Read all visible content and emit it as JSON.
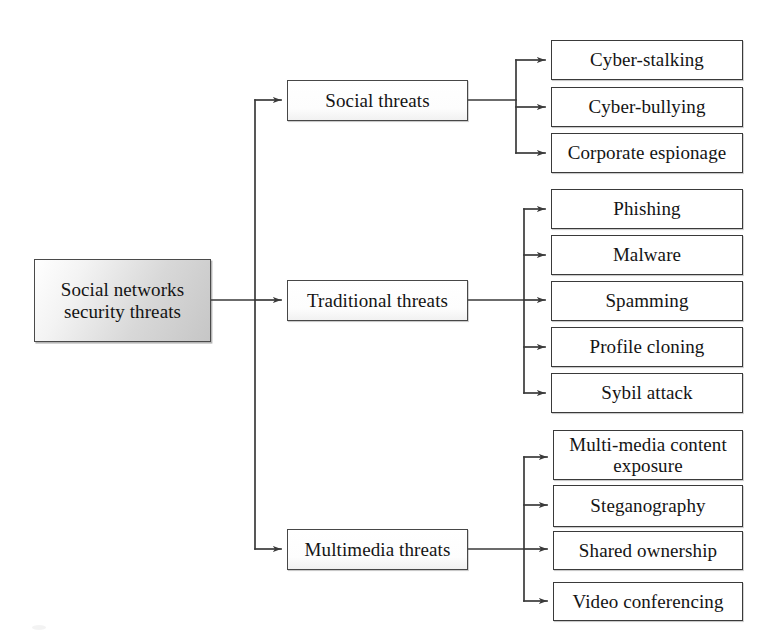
{
  "diagram": {
    "title": "Social networks security threats",
    "type": "tree-hierarchy",
    "orientation": "left-to-right",
    "background_color": "#ffffff",
    "line_color": "#3a3a3a",
    "root_fill_color": "#d8d8d8",
    "box_fill_color": "#ffffff"
  },
  "root": {
    "label": "Social networks\nsecurity threats"
  },
  "branches": [
    {
      "id": "social",
      "label": "Social threats",
      "children": [
        {
          "label": "Cyber-stalking"
        },
        {
          "label": "Cyber-bullying"
        },
        {
          "label": "Corporate espionage"
        }
      ]
    },
    {
      "id": "traditional",
      "label": "Traditional threats",
      "children": [
        {
          "label": "Phishing"
        },
        {
          "label": "Malware"
        },
        {
          "label": "Spamming"
        },
        {
          "label": "Profile cloning"
        },
        {
          "label": "Sybil attack"
        }
      ]
    },
    {
      "id": "multimedia",
      "label": "Multimedia threats",
      "children": [
        {
          "label": "Multi-media content\nexposure"
        },
        {
          "label": "Steganography"
        },
        {
          "label": "Shared ownership"
        },
        {
          "label": "Video conferencing"
        }
      ]
    }
  ]
}
